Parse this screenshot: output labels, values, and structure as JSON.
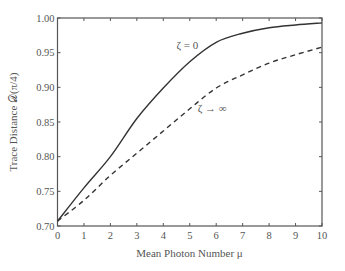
{
  "chart_data": {
    "type": "line",
    "title": "",
    "xlabel": "Mean Photon Number μ",
    "ylabel": "Trace Distance 𝒟(π/4)",
    "xlim": [
      0,
      10
    ],
    "ylim": [
      0.7,
      1.0
    ],
    "xticks": [
      "0",
      "1",
      "2",
      "3",
      "4",
      "5",
      "6",
      "7",
      "8",
      "9",
      "10"
    ],
    "yticks": [
      "0.70",
      "0.75",
      "0.80",
      "0.85",
      "0.90",
      "0.95",
      "1.00"
    ],
    "grid": false,
    "legend": "none (inline annotations)",
    "x": [
      0,
      1,
      2,
      3,
      4,
      5,
      6,
      7,
      8,
      9,
      10
    ],
    "series": [
      {
        "name": "ζ = 0",
        "style": "solid",
        "values": [
          0.707,
          0.755,
          0.8,
          0.855,
          0.899,
          0.937,
          0.965,
          0.978,
          0.986,
          0.99,
          0.993
        ]
      },
      {
        "name": "ζ → ∞",
        "style": "dashed",
        "values": [
          0.707,
          0.737,
          0.773,
          0.805,
          0.837,
          0.869,
          0.899,
          0.918,
          0.935,
          0.947,
          0.958
        ]
      }
    ],
    "annotations": [
      {
        "text": "ζ = 0",
        "x": 4.5,
        "y": 0.955
      },
      {
        "text": "ζ → ∞",
        "x": 5.3,
        "y": 0.865
      }
    ]
  }
}
